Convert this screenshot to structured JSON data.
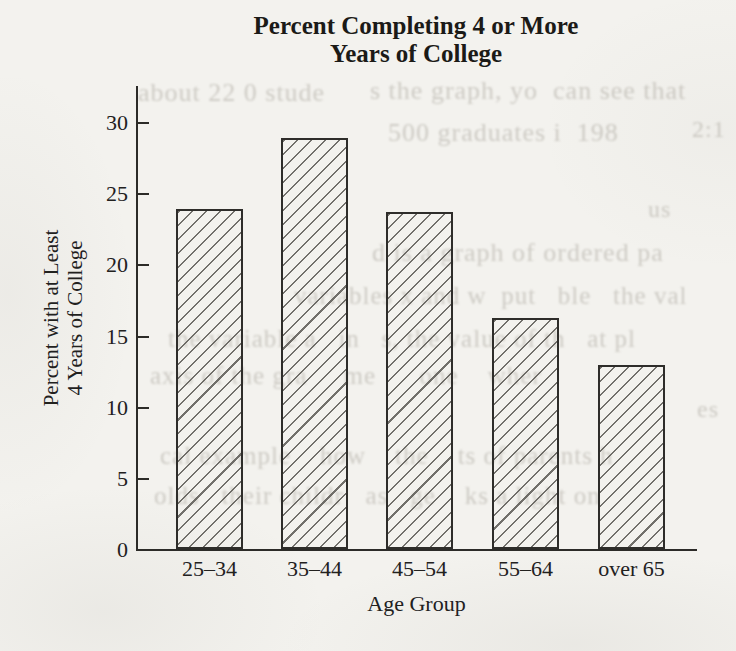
{
  "page": {
    "background_color": "#f3f2ee",
    "ink_color": "#2c2b28",
    "hatch_color": "#52504b",
    "kind": "scanned textbook bar chart"
  },
  "chart_data": {
    "type": "bar",
    "title_line1": "Percent Completing 4 or More",
    "title_line2": "Years of College",
    "xlabel": "Age Group",
    "ylabel_line1": "Percent with at Least",
    "ylabel_line2": "4 Years of College",
    "categories": [
      "25–34",
      "35–44",
      "45–54",
      "55–64",
      "over 65"
    ],
    "values": [
      23.9,
      28.9,
      23.7,
      16.2,
      12.9
    ],
    "y_ticks": [
      0,
      5,
      10,
      15,
      20,
      25,
      30
    ],
    "ylim": [
      0,
      32
    ],
    "grid": "off",
    "legend": "none",
    "bar_style": "diagonal-hatch"
  },
  "bleedthrough_fragments": [
    {
      "text": "about 22 0 stude",
      "x": 138,
      "y": 78,
      "size": 26
    },
    {
      "text": "s the graph, yo  can see that",
      "x": 370,
      "y": 76,
      "size": 26
    },
    {
      "text": "500 graduates i  198",
      "x": 388,
      "y": 118,
      "size": 26
    },
    {
      "text": "2:1",
      "x": 692,
      "y": 116,
      "size": 24
    },
    {
      "text": "us",
      "x": 648,
      "y": 196,
      "size": 24
    },
    {
      "text": "d is a graph of ordered pa",
      "x": 372,
      "y": 238,
      "size": 26
    },
    {
      "text": "variables x and w  put   ble   the val",
      "x": 294,
      "y": 282,
      "size": 25
    },
    {
      "text": "the variable a   in   s, the value of th   at pl",
      "x": 168,
      "y": 325,
      "size": 25
    },
    {
      "text": "axis of the gra     me      one    wher",
      "x": 150,
      "y": 362,
      "size": 25
    },
    {
      "text": "es",
      "x": 697,
      "y": 396,
      "size": 24
    },
    {
      "text": "cal example    how    the    ts of parents h",
      "x": 160,
      "y": 442,
      "size": 25
    },
    {
      "text": "olds   their childr   as   ge    ks a light on",
      "x": 154,
      "y": 482,
      "size": 25
    }
  ]
}
